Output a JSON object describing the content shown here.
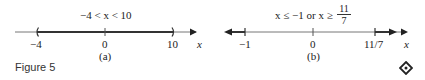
{
  "figure": {
    "caption": "Figure 5",
    "end_icon": "diamond-end-mark-icon"
  },
  "panels": [
    {
      "id": "a",
      "label": "(a)",
      "title": "−4 < x < 10",
      "axis_var": "x",
      "ticks": [
        {
          "value": -4,
          "label": "−4"
        },
        {
          "value": 0,
          "label": "0"
        },
        {
          "value": 10,
          "label": "10"
        }
      ],
      "interval": {
        "type": "open",
        "from": -4,
        "to": 10
      }
    },
    {
      "id": "b",
      "label": "(b)",
      "title_prefix": "x ≤ −1 or x ≥",
      "title_frac_num": "11",
      "title_frac_den": "7",
      "axis_var": "x",
      "ticks": [
        {
          "value": -1,
          "label": "−1"
        },
        {
          "value": 0,
          "label": "0"
        },
        {
          "value": 1.5714,
          "label": "11/7"
        }
      ],
      "intervals": [
        {
          "type": "closed-left-ray",
          "to": -1
        },
        {
          "type": "closed-right-ray",
          "from": 1.5714
        }
      ]
    }
  ],
  "colors": {
    "line": "#555555",
    "thick": "#333333",
    "text": "#222222"
  }
}
